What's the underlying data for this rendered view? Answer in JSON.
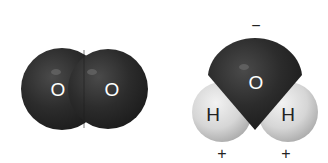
{
  "molecules": [
    {
      "name": "oxygen",
      "atoms": [
        {
          "symbol": "O",
          "label": "O"
        },
        {
          "symbol": "O",
          "label": "O"
        }
      ]
    },
    {
      "name": "water",
      "atoms": [
        {
          "symbol": "O",
          "label": "O"
        },
        {
          "symbol": "H",
          "label": "H"
        },
        {
          "symbol": "H",
          "label": "H"
        }
      ],
      "charges": {
        "oxygen": "−",
        "hydrogen_left": "+",
        "hydrogen_right": "+"
      }
    }
  ],
  "colors": {
    "oxygen": "#2b2b2b",
    "hydrogen": "#d9d9d9",
    "label_on_dark": "#ffffff",
    "label_on_light": "#222222",
    "charge": "#222222"
  }
}
